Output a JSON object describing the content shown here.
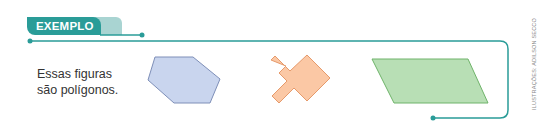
{
  "header": {
    "tab_label": "EXEMPLO"
  },
  "content": {
    "text_line1": "Essas figuras",
    "text_line2": "são polígonos."
  },
  "figures": [
    {
      "name": "hexagon",
      "fill": "#c9d5ee",
      "stroke": "#7e8fb8"
    },
    {
      "name": "cross-diamond-shape",
      "fill": "#fbc8a5",
      "stroke": "#e69a6b"
    },
    {
      "name": "parallelogram",
      "fill": "#b8dfb5",
      "stroke": "#6fb36a"
    }
  ],
  "colors": {
    "accent_teal": "#2a9c98",
    "accent_teal_light": "#a9d4d2"
  },
  "credit": "ILUSTRAÇÕES: ADILSON SECCO"
}
